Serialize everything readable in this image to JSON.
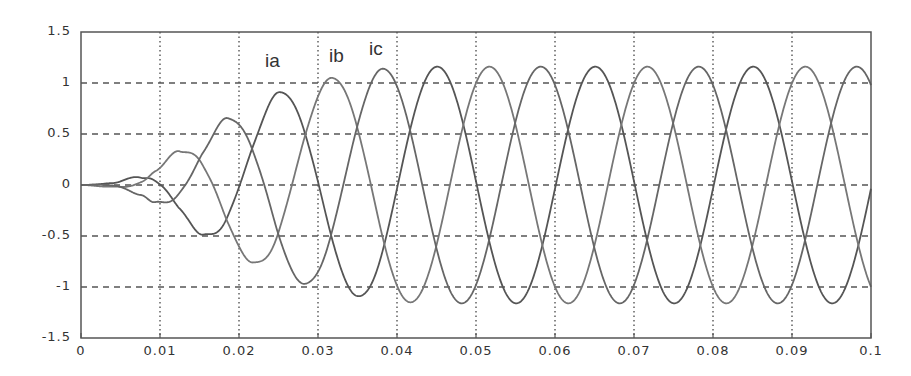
{
  "chart_data": {
    "type": "line",
    "title": "",
    "xlabel": "",
    "ylabel": "",
    "xlim": [
      0,
      0.1
    ],
    "ylim": [
      -1.5,
      1.5
    ],
    "grid": true,
    "x_ticks": [
      "0",
      "0.01",
      "0.02",
      "0.03",
      "0.04",
      "0.05",
      "0.06",
      "0.07",
      "0.08",
      "0.09",
      "0.1"
    ],
    "y_ticks": [
      "1.5",
      "1",
      "0.5",
      "0",
      "-0.5",
      "-1",
      "-1.5"
    ],
    "frequency_hz": 50,
    "steady_state_amplitude": 1.16,
    "series": [
      {
        "name": "ia",
        "label_pos": {
          "x": 265,
          "y": 50
        },
        "first_peak_t": 0.0251,
        "color": "#555555"
      },
      {
        "name": "ib",
        "label_pos": {
          "x": 329,
          "y": 45
        },
        "first_peak_t": 0.0317,
        "color": "#777777"
      },
      {
        "name": "ic",
        "label_pos": {
          "x": 369,
          "y": 38
        },
        "first_peak_t": 0.0382,
        "color": "#666666"
      }
    ],
    "envelope": {
      "t": [
        0,
        0.004,
        0.0076,
        0.0094,
        0.0125,
        0.0155,
        0.0186,
        0.0218,
        0.0251,
        0.0284,
        0.0317,
        0.035,
        0.0382,
        0.0416,
        0.045,
        0.1
      ],
      "amp": [
        0,
        0.02,
        0.1,
        0.18,
        0.34,
        0.49,
        0.66,
        0.76,
        0.91,
        0.97,
        1.05,
        1.09,
        1.14,
        1.15,
        1.16,
        1.16
      ]
    },
    "extrema_observed": [
      {
        "t": 0.0076,
        "value": 0.1
      },
      {
        "t": 0.0094,
        "value": -0.18
      },
      {
        "t": 0.0125,
        "value": 0.34
      },
      {
        "t": 0.0155,
        "value": -0.49
      },
      {
        "t": 0.0186,
        "value": 0.66
      },
      {
        "t": 0.0218,
        "value": -0.76
      },
      {
        "t": 0.0251,
        "value": 0.91
      },
      {
        "t": 0.0284,
        "value": -0.97
      },
      {
        "t": 0.0317,
        "value": 1.05
      },
      {
        "t": 0.035,
        "value": -1.09
      },
      {
        "t": 0.0382,
        "value": 1.14
      },
      {
        "t": 0.0416,
        "value": -1.15
      }
    ],
    "values_at_end": {
      "t": 0.1,
      "values": [
        1.0,
        0.0,
        -1.0
      ]
    }
  }
}
